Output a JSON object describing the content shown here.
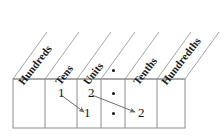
{
  "diagram": {
    "columns": [
      {
        "id": "hundreds",
        "label": "Hundreds",
        "x_left": 13,
        "x_right": 45
      },
      {
        "id": "tens",
        "label": "Tens",
        "x_left": 45,
        "x_right": 77
      },
      {
        "id": "units",
        "label": "Units",
        "x_left": 77,
        "x_right": 101
      },
      {
        "id": "point",
        "label": ".",
        "x_left": 101,
        "x_right": 125
      },
      {
        "id": "tenths",
        "label": "Tenths",
        "x_left": 125,
        "x_right": 157
      },
      {
        "id": "hundredths",
        "label": "Hundredths",
        "x_left": 157,
        "x_right": 185
      }
    ],
    "header_decimal_dot": ".",
    "rows": [
      {
        "id": "row-top",
        "cells": [
          {
            "column": "hundreds",
            "value": ""
          },
          {
            "column": "tens",
            "value": "1"
          },
          {
            "column": "units",
            "value": "2"
          },
          {
            "column": "point",
            "value": "."
          },
          {
            "column": "tenths",
            "value": ""
          },
          {
            "column": "hundredths",
            "value": ""
          }
        ]
      },
      {
        "id": "row-bottom",
        "cells": [
          {
            "column": "hundreds",
            "value": ""
          },
          {
            "column": "tens",
            "value": ""
          },
          {
            "column": "units",
            "value": "1"
          },
          {
            "column": "point",
            "value": "."
          },
          {
            "column": "tenths",
            "value": "2"
          },
          {
            "column": "hundredths",
            "value": ""
          }
        ]
      }
    ],
    "arrows": [
      {
        "id": "arrow-tens-to-units",
        "from_column": "tens",
        "to_column": "units",
        "from_digit": "1",
        "to_digit": "1"
      },
      {
        "id": "arrow-units-to-tenths",
        "from_column": "units",
        "to_column": "tenths",
        "from_digit": "2",
        "to_digit": "2"
      }
    ],
    "colors": {
      "line": "#8c8c8c",
      "text": "#111111",
      "arrow": "#6f6f6f",
      "background": "#ffffff"
    }
  }
}
